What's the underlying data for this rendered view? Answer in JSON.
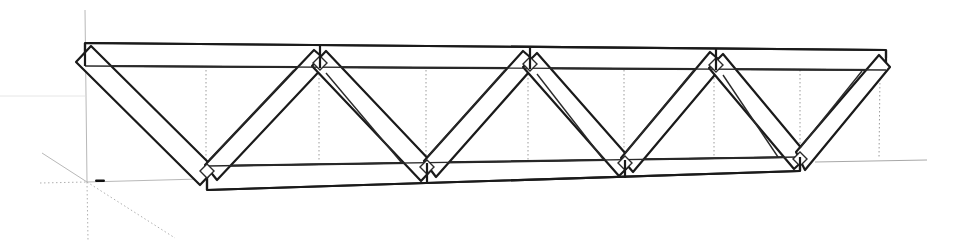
{
  "scene": {
    "type": "3d-wireframe-model",
    "subject": "warren-truss",
    "background": "#ffffff",
    "edge_color": "#1a1a1a",
    "hidden_edge_color": "#9a9a9a",
    "axis_color": "#b8b8b8"
  },
  "truss": {
    "top_chord": {
      "left_x": 85,
      "right_x": 886,
      "top_y_left": 43,
      "top_y_right": 50,
      "bottom_y_left": 66,
      "bottom_y_right": 70
    },
    "bottom_chord": {
      "left_x": 207,
      "right_x": 800,
      "top_y_left": 166,
      "top_y_right": 157,
      "bottom_y_left": 190,
      "bottom_y_right": 171
    },
    "top_joints_x": [
      85,
      320,
      530,
      716,
      886
    ],
    "bottom_joints_x": [
      207,
      427,
      625,
      800
    ],
    "web_member_count": 8
  },
  "origin": {
    "x": 87,
    "y": 182,
    "label": ""
  }
}
